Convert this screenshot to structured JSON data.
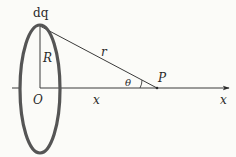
{
  "diagram": {
    "colors": {
      "ring": "#555555",
      "lines": "#3a3a3a",
      "background": "#fbfbf8"
    },
    "labels": {
      "charge_element": "dq",
      "radius": "R",
      "origin": "O",
      "distance": "x",
      "separation": "r",
      "angle": "θ",
      "point": "P",
      "axis": "x"
    }
  }
}
